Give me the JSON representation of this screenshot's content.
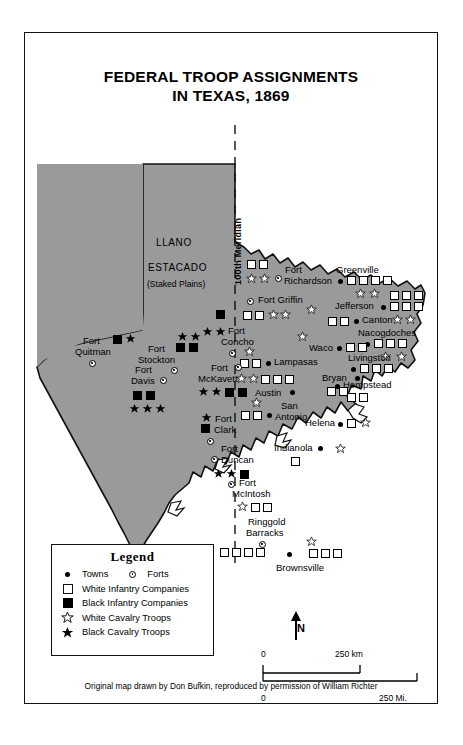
{
  "title": {
    "line1": "FEDERAL TROOP ASSIGNMENTS",
    "line2": "IN TEXAS, 1869"
  },
  "regions": {
    "llano": "LLANO",
    "estacado": "ESTACADO",
    "staked_plains": "(Staked Plains)",
    "meridian": "100th Meridian"
  },
  "places": [
    {
      "name": "Fort Richardson",
      "kind": "fort",
      "label_line1": "Fort",
      "label_line2": "Richardson"
    },
    {
      "name": "Fort Griffin",
      "kind": "fort",
      "label_line1": "Fort Griffin"
    },
    {
      "name": "Greenville",
      "kind": "town",
      "label_line1": "Greenville"
    },
    {
      "name": "Jefferson",
      "kind": "town",
      "label_line1": "Jefferson"
    },
    {
      "name": "Canton",
      "kind": "town",
      "label_line1": "Canton"
    },
    {
      "name": "Nacogdoches",
      "kind": "town",
      "label_line1": "Nacogdoches"
    },
    {
      "name": "Waco",
      "kind": "town",
      "label_line1": "Waco"
    },
    {
      "name": "Lampasas",
      "kind": "town",
      "label_line1": "Lampasas"
    },
    {
      "name": "Bryan",
      "kind": "town",
      "label_line1": "Bryan"
    },
    {
      "name": "Austin",
      "kind": "town",
      "label_line1": "Austin"
    },
    {
      "name": "San Antonio",
      "kind": "town",
      "label_line1": "San",
      "label_line2": "Antonio"
    },
    {
      "name": "Livingston",
      "kind": "town",
      "label_line1": "Livingston"
    },
    {
      "name": "Hempstead",
      "kind": "town",
      "label_line1": "Hempstead"
    },
    {
      "name": "Helena",
      "kind": "town",
      "label_line1": "Helena"
    },
    {
      "name": "Indianola",
      "kind": "town",
      "label_line1": "Indianola"
    },
    {
      "name": "Brownsville",
      "kind": "town",
      "label_line1": "Brownsville"
    },
    {
      "name": "Fort Quitman",
      "kind": "fort",
      "label_line1": "Fort",
      "label_line2": "Quitman"
    },
    {
      "name": "Fort Stockton",
      "kind": "fort",
      "label_line1": "Fort",
      "label_line2": "Stockton"
    },
    {
      "name": "Fort Davis",
      "kind": "fort",
      "label_line1": "Fort",
      "label_line2": "Davis"
    },
    {
      "name": "Fort Concho",
      "kind": "fort",
      "label_line1": "Fort",
      "label_line2": "Concho"
    },
    {
      "name": "Fort McKavett",
      "kind": "fort",
      "label_line1": "Fort",
      "label_line2": "McKavett"
    },
    {
      "name": "Fort Clark",
      "kind": "fort",
      "label_line1": "Fort",
      "label_line2": "Clark"
    },
    {
      "name": "Fort Duncan",
      "kind": "fort",
      "label_line1": "Fort",
      "label_line2": "Duncan"
    },
    {
      "name": "Fort McIntosh",
      "kind": "fort",
      "label_line1": "Fort",
      "label_line2": "McIntosh"
    },
    {
      "name": "Ringgold Barracks",
      "kind": "fort",
      "label_line1": "Ringgold",
      "label_line2": "Barracks"
    }
  ],
  "map_labels": {
    "fort_richardson_1": "Fort",
    "fort_richardson_2": "Richardson",
    "fort_griffin": "Fort Griffin",
    "greenville": "Greenville",
    "jefferson": "Jefferson",
    "canton": "Canton",
    "nacogdoches": "Nacogdoches",
    "waco": "Waco",
    "lampasas": "Lampasas",
    "bryan": "Bryan",
    "austin": "Austin",
    "san": "San",
    "antonio": "Antonio",
    "livingston": "Livingston",
    "hempstead": "Hempstead",
    "helena": "Helena",
    "indianola": "Indianola",
    "brownsville": "Brownsville",
    "fort_quitman_1": "Fort",
    "fort_quitman_2": "Quitman",
    "fort_stockton_1": "Fort",
    "fort_stockton_2": "Stockton",
    "fort_davis_1": "Fort",
    "fort_davis_2": "Davis",
    "fort_concho_1": "Fort",
    "fort_concho_2": "Concho",
    "fort_mckavett_1": "Fort",
    "fort_mckavett_2": "McKavett",
    "fort_clark_1": "Fort",
    "fort_clark_2": "Clark",
    "fort_duncan_1": "Fort",
    "fort_duncan_2": "Duncan",
    "fort_mcintosh_1": "Fort",
    "fort_mcintosh_2": "McIntosh",
    "ringgold_1": "Ringgold",
    "ringgold_2": "Barracks"
  },
  "troop_counts": {
    "fort_richardson": {
      "white_infantry": 2,
      "white_cavalry": 2
    },
    "greenville": {
      "white_infantry": 4,
      "white_cavalry": 2
    },
    "fort_griffin": {
      "white_infantry": 2,
      "white_cavalry": 2
    },
    "jefferson": {
      "white_infantry": 6,
      "white_cavalry": 2
    },
    "canton": {
      "white_infantry": 2
    },
    "nacogdoches": {
      "white_infantry": 3,
      "white_cavalry": 1
    },
    "waco": {
      "white_infantry": 2,
      "white_cavalry": 1
    },
    "lampasas": {
      "white_infantry": 2,
      "white_cavalry": 1
    },
    "austin": {
      "white_infantry": 3,
      "white_cavalry": 2
    },
    "bryan": {
      "white_infantry": 2
    },
    "san_antonio": {
      "white_infantry": 2,
      "white_cavalry": 1
    },
    "livingston": {
      "white_infantry": 3,
      "white_cavalry": 1
    },
    "hempstead": {
      "white_infantry": 2
    },
    "helena": {
      "white_infantry": 1,
      "white_cavalry": 1
    },
    "indianola": {
      "white_infantry": 1,
      "white_cavalry": 1
    },
    "fort_mcintosh": {
      "white_infantry": 2,
      "white_cavalry": 1
    },
    "ringgold_barracks": {
      "white_infantry": 4
    },
    "brownsville": {
      "white_infantry": 3,
      "white_cavalry": 1
    },
    "fort_quitman": {
      "black_infantry": 1,
      "black_cavalry": 1
    },
    "fort_stockton": {
      "black_infantry": 2,
      "black_cavalry": 2
    },
    "fort_davis": {
      "black_infantry": 2,
      "black_cavalry": 3
    },
    "fort_concho": {
      "black_infantry": 1,
      "black_cavalry": 2
    },
    "fort_mckavett": {
      "black_infantry": 2,
      "black_cavalry": 2
    },
    "fort_clark": {
      "black_infantry": 1,
      "black_cavalry": 1
    },
    "fort_duncan": {
      "black_infantry": 1,
      "black_cavalry": 2
    }
  },
  "legend": {
    "heading": "Legend",
    "towns": "Towns",
    "forts": "Forts",
    "items": [
      {
        "symbol": "white-square",
        "label": "White Infantry Companies"
      },
      {
        "symbol": "black-square",
        "label": "Black Infantry Companies"
      },
      {
        "symbol": "white-star",
        "label": "White Cavalry Troops"
      },
      {
        "symbol": "black-star",
        "label": "Black Cavalry Troops"
      }
    ]
  },
  "compass": {
    "north": "N"
  },
  "scale": {
    "km_zero": "0",
    "km_max": "250 km",
    "mi_zero": "0",
    "mi_max": "250 Mi."
  },
  "credit": "Original map drawn by Don Bufkin, reproduced by permission of William Richter",
  "colors": {
    "land": "#9a9a9a",
    "ink": "#111111",
    "paper": "#ffffff"
  }
}
